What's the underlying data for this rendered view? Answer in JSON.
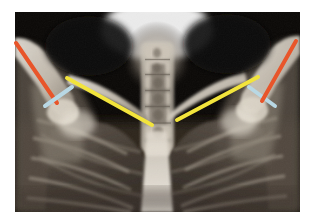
{
  "figure": {
    "kind": "radiograph-with-annotations",
    "modality": "X-ray",
    "view": "AP chest / shoulder girdle",
    "region": "Chest, clavicles and proximal humeri",
    "background_color": "#ffffff",
    "plate": {
      "x": 15,
      "y": 12,
      "width": 285,
      "height": 200,
      "dark_color": "#0c0a08",
      "bone_color": "#e8e2d8",
      "soft_tissue_color": "#6b635a",
      "lung_color": "#3b332c"
    }
  },
  "annotations": {
    "colors": {
      "humerus_axis": "#e8552a",
      "joint_line": "#b8d8e4",
      "clavicle_axis": "#f2e43c"
    },
    "lines": [
      {
        "id": "humerus-axis-right",
        "label": "Right humeral shaft axis",
        "color": "#e8552a",
        "x1": 16,
        "y1": 43,
        "x2": 57,
        "y2": 103,
        "thickness": 4
      },
      {
        "id": "glenohumeral-line-right",
        "label": "Right glenohumeral joint line",
        "color": "#b8d8e4",
        "x1": 45,
        "y1": 106,
        "x2": 72,
        "y2": 87,
        "thickness": 4
      },
      {
        "id": "clavicle-axis-right",
        "label": "Right clavicular axis",
        "color": "#f2e43c",
        "x1": 67,
        "y1": 78,
        "x2": 152,
        "y2": 125,
        "thickness": 4
      },
      {
        "id": "clavicle-axis-left",
        "label": "Left clavicular axis",
        "color": "#f2e43c",
        "x1": 177,
        "y1": 120,
        "x2": 258,
        "y2": 77,
        "thickness": 4
      },
      {
        "id": "glenohumeral-line-left",
        "label": "Left glenohumeral joint line",
        "color": "#b8d8e4",
        "x1": 249,
        "y1": 87,
        "x2": 275,
        "y2": 106,
        "thickness": 4
      },
      {
        "id": "humerus-axis-left",
        "label": "Left humeral shaft axis",
        "color": "#e8552a",
        "x1": 296,
        "y1": 41,
        "x2": 262,
        "y2": 101,
        "thickness": 4
      }
    ]
  },
  "anatomy": {
    "structures": [
      {
        "id": "cervical-spine",
        "label": "Cervical / upper thoracic spine"
      },
      {
        "id": "trachea",
        "label": "Tracheal air column"
      },
      {
        "id": "clavicle-right",
        "label": "Right clavicle"
      },
      {
        "id": "clavicle-left",
        "label": "Left clavicle"
      },
      {
        "id": "humerus-right",
        "label": "Right proximal humerus"
      },
      {
        "id": "humerus-left",
        "label": "Left proximal humerus"
      },
      {
        "id": "scapula-right",
        "label": "Right scapula"
      },
      {
        "id": "scapula-left",
        "label": "Left scapula"
      },
      {
        "id": "ribcage",
        "label": "Rib cage"
      },
      {
        "id": "lung-field-right",
        "label": "Right lung field"
      },
      {
        "id": "lung-field-left",
        "label": "Left lung field"
      },
      {
        "id": "mandible-shadow",
        "label": "Mandible / chin shadow"
      }
    ]
  }
}
